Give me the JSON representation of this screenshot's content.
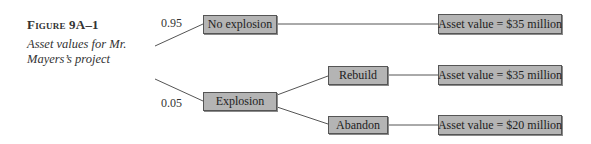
{
  "figure": {
    "number": "Figure 9A–1",
    "caption": "Asset values for Mr. Mayers’s project"
  },
  "tree": {
    "branches": [
      {
        "probability": "0.95",
        "event": "No explosion",
        "outcome": "Asset value = $35 million"
      },
      {
        "probability": "0.05",
        "event": "Explosion",
        "decisions": [
          {
            "action": "Rebuild",
            "outcome": "Asset value = $35 million"
          },
          {
            "action": "Abandon",
            "outcome": "Asset value = $20 million"
          }
        ]
      }
    ]
  },
  "colors": {
    "box_fill": "#b4b4b4",
    "box_border": "#555555",
    "line": "#555555"
  }
}
